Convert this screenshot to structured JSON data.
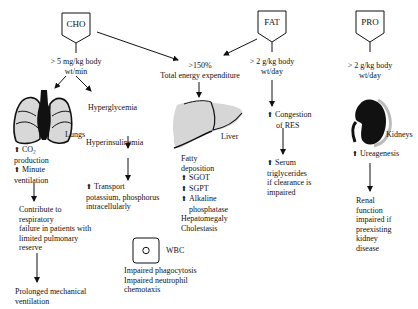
{
  "nodes": {
    "cho": {
      "label": "CHO"
    },
    "fat": {
      "label": "FAT"
    },
    "pro": {
      "label": "PRO"
    },
    "cho_threshold": {
      "line1": "> 5 mg/kg body",
      "line2": "wt/min"
    },
    "fat_threshold": {
      "line1": "> 2 g/kg body",
      "line2": "wt/day"
    },
    "pro_threshold": {
      "line1": "> 2 g/kg body",
      "line2": "wt/day"
    },
    "energy": {
      "line1": ">150%",
      "line2": "Total energy expenditure"
    },
    "lungs": {
      "organ_label": "Lungs",
      "effects": [
        "CO₂ production",
        "Minute ventilation"
      ],
      "effect1_line1": "CO₂",
      "effect1_line2": "production",
      "effect2_line1": "Minute",
      "effect2_line2": "ventilation",
      "consequence": [
        "Contribute to",
        "respiratory",
        "failure in patients with",
        "limited pulmonary",
        "reserve"
      ],
      "final": [
        "Prolonged mechanical",
        "ventilation"
      ]
    },
    "hyperglycemia": {
      "label": "Hyperglycemia",
      "next": "Hyperinsulinemia",
      "transport_line1": "Transport",
      "transport_line2": "potassium, phosphorus",
      "transport_line3": "intracellularly"
    },
    "liver": {
      "organ_label": "Liver",
      "effects": [
        "Fatty",
        "deposition",
        "SGOT",
        "SGPT",
        "Alkaline",
        "phosphatase",
        "Hepatomegaly",
        "Cholestasis"
      ]
    },
    "wbc": {
      "label": "WBC",
      "effects": [
        "Impaired phagocytosis",
        "Impaired neutrophil",
        "chemotaxis"
      ]
    },
    "res": {
      "line1": "Congestion",
      "line2": "of RES",
      "serum": [
        "Serum",
        "triglycerides",
        "if clearance is",
        "impaired"
      ]
    },
    "kidneys": {
      "organ_label": "Kidneys",
      "effect": "Ureagenesis",
      "consequence": [
        "Renal",
        "function",
        "impaired if",
        "preexisting",
        "kidney",
        "disease"
      ]
    }
  },
  "colors": {
    "ink": "#111111",
    "organ_fill": "#d8d8d8",
    "background": "#ffffff"
  }
}
